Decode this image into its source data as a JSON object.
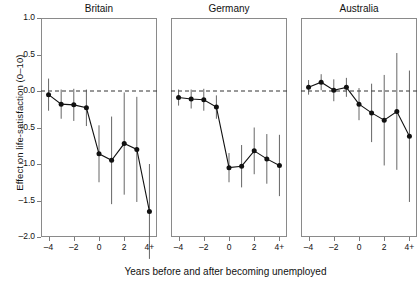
{
  "chart_data": {
    "type": "line",
    "title": "",
    "xlabel": "Years before and after becoming unemployed",
    "ylabel": "Effect on life-satisfaction (0–10)",
    "ylim": [
      -2.0,
      1.0
    ],
    "yticks": [
      1.0,
      0.5,
      0.0,
      -0.5,
      -1.0,
      -1.5,
      -2.0
    ],
    "ytick_labels": [
      "1.0",
      "0.5",
      "0.0",
      "–0.5",
      "–1.0",
      "–1.5",
      "–2.0"
    ],
    "x": [
      -4,
      -3,
      -2,
      -1,
      0,
      1,
      2,
      3,
      4
    ],
    "xticks": [
      -4,
      -2,
      0,
      2,
      4
    ],
    "xtick_labels": [
      "–4",
      "–2",
      "0",
      "2",
      "4+"
    ],
    "grid": false,
    "legend": "none",
    "reference_line": {
      "y": 0.0,
      "style": "dashed"
    },
    "error_bars": "vertical lines, 95% confidence interval",
    "marker": "filled circle",
    "panels": [
      {
        "name": "Britain",
        "values": [
          -0.05,
          -0.18,
          -0.19,
          -0.23,
          -0.86,
          -0.95,
          -0.72,
          -0.8,
          -1.65
        ],
        "err_low": [
          -0.27,
          -0.38,
          -0.41,
          -0.48,
          -1.25,
          -1.55,
          -1.42,
          -1.52,
          -2.3
        ],
        "err_high": [
          0.17,
          0.02,
          0.03,
          0.02,
          -0.47,
          -0.35,
          -0.02,
          -0.08,
          -1.0
        ]
      },
      {
        "name": "Germany",
        "values": [
          -0.09,
          -0.11,
          -0.12,
          -0.22,
          -1.05,
          -1.03,
          -0.82,
          -0.93,
          -1.02
        ],
        "err_low": [
          -0.2,
          -0.24,
          -0.27,
          -0.38,
          -1.25,
          -1.32,
          -1.14,
          -1.27,
          -1.44
        ],
        "err_high": [
          0.02,
          0.02,
          0.03,
          -0.06,
          -0.85,
          -0.74,
          -0.5,
          -0.59,
          -0.6
        ]
      },
      {
        "name": "Australia",
        "values": [
          0.05,
          0.12,
          0.01,
          0.05,
          -0.18,
          -0.3,
          -0.4,
          -0.28,
          -0.62
        ],
        "err_low": [
          -0.05,
          0.01,
          -0.14,
          -0.08,
          -0.4,
          -0.7,
          -1.02,
          -1.08,
          -1.52
        ],
        "err_high": [
          0.15,
          0.23,
          0.16,
          0.18,
          0.04,
          0.1,
          0.22,
          0.52,
          0.28
        ]
      }
    ]
  },
  "style": {
    "line_color": "#111111",
    "marker_color": "#111111",
    "error_color": "#555555",
    "frame_color": "#8a8a8a",
    "reference_color": "#333333",
    "background": "#ffffff"
  }
}
